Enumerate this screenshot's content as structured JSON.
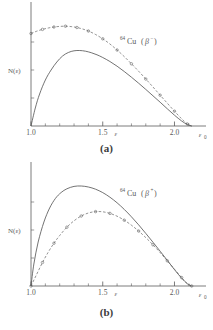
{
  "figure": {
    "background_color": "#ffffff",
    "ink_color": "#5a5a5a",
    "panels": [
      {
        "id": "a",
        "caption": "(a)",
        "ylabel": "N(ε)",
        "xlabel": "ε",
        "endpoint_label": "ε",
        "endpoint_sub": "0",
        "nuclide_mass": "64",
        "nuclide_symbol": "Cu",
        "decay_open": "(",
        "decay_beta": "β",
        "decay_sign": "−",
        "decay_close": ")",
        "series_label_full": "⁶⁴Cu (β⁻)",
        "ticks": [
          {
            "value": 1.0,
            "label": "1.0"
          },
          {
            "value": 1.5,
            "label": "1.5"
          },
          {
            "value": 2.0,
            "label": "2.0"
          }
        ]
      },
      {
        "id": "b",
        "caption": "(b)",
        "ylabel": "N(ε)",
        "xlabel": "ε",
        "endpoint_label": "ε",
        "endpoint_sub": "0",
        "nuclide_mass": "64",
        "nuclide_symbol": "Cu",
        "decay_open": "(",
        "decay_beta": "β",
        "decay_sign": "+",
        "decay_close": ")",
        "series_label_full": "⁶⁴Cu (β⁺)",
        "ticks": [
          {
            "value": 1.0,
            "label": "1.0"
          },
          {
            "value": 1.5,
            "label": "1.5"
          },
          {
            "value": 2.0,
            "label": "2.0"
          }
        ]
      }
    ]
  },
  "chart_data": [
    {
      "type": "line",
      "panel": "a",
      "title": "⁶⁴Cu (β⁻) beta spectrum",
      "xlabel": "ε",
      "ylabel": "N(ε)",
      "xlim": [
        1.0,
        2.15
      ],
      "ylim": [
        0,
        1.12
      ],
      "grid": false,
      "legend": "none",
      "endpoint_energy": 2.12,
      "xticks": [
        1.0,
        1.5,
        2.0
      ],
      "xticklabels": [
        "1.0",
        "1.5",
        "2.0"
      ],
      "minor_ticks_per_interval": 4,
      "series": [
        {
          "name": "theoretical-statistical-shape",
          "style": "solid",
          "markers": false,
          "x": [
            1.0,
            1.03,
            1.06,
            1.1,
            1.14,
            1.18,
            1.22,
            1.26,
            1.3,
            1.34,
            1.38,
            1.42,
            1.46,
            1.5,
            1.55,
            1.6,
            1.65,
            1.7,
            1.75,
            1.8,
            1.85,
            1.9,
            1.95,
            2.0,
            2.05,
            2.09,
            2.12
          ],
          "y": [
            0.0,
            0.18,
            0.32,
            0.46,
            0.56,
            0.64,
            0.7,
            0.735,
            0.752,
            0.755,
            0.748,
            0.733,
            0.712,
            0.685,
            0.645,
            0.598,
            0.545,
            0.488,
            0.428,
            0.366,
            0.302,
            0.238,
            0.172,
            0.108,
            0.05,
            0.014,
            0.0
          ]
        },
        {
          "name": "measured-corrected-spectrum",
          "style": "dashed",
          "markers": true,
          "marker_shape": "circle",
          "x": [
            1.0,
            1.04,
            1.08,
            1.12,
            1.16,
            1.2,
            1.24,
            1.28,
            1.32,
            1.36,
            1.4,
            1.45,
            1.5,
            1.55,
            1.6,
            1.65,
            1.7,
            1.75,
            1.8,
            1.85,
            1.9,
            1.95,
            2.0,
            2.05,
            2.09,
            2.12
          ],
          "y": [
            0.925,
            0.948,
            0.966,
            0.98,
            0.99,
            0.996,
            0.998,
            0.994,
            0.985,
            0.97,
            0.95,
            0.915,
            0.872,
            0.82,
            0.76,
            0.694,
            0.622,
            0.548,
            0.47,
            0.39,
            0.308,
            0.228,
            0.148,
            0.072,
            0.02,
            0.0
          ]
        }
      ],
      "annotations": [
        {
          "text": "⁶⁴Cu (β⁻)",
          "x": 1.62,
          "y": 0.82
        }
      ]
    },
    {
      "type": "line",
      "panel": "b",
      "title": "⁶⁴Cu (β⁺) beta spectrum",
      "xlabel": "ε",
      "ylabel": "N(ε)",
      "xlim": [
        1.0,
        2.15
      ],
      "ylim": [
        0,
        1.12
      ],
      "grid": false,
      "legend": "none",
      "endpoint_energy": 2.12,
      "xticks": [
        1.0,
        1.5,
        2.0
      ],
      "xticklabels": [
        "1.0",
        "1.5",
        "2.0"
      ],
      "minor_ticks_per_interval": 4,
      "series": [
        {
          "name": "theoretical-statistical-shape",
          "style": "solid",
          "markers": false,
          "x": [
            1.0,
            1.02,
            1.05,
            1.09,
            1.13,
            1.17,
            1.21,
            1.25,
            1.3,
            1.35,
            1.4,
            1.45,
            1.5,
            1.55,
            1.6,
            1.65,
            1.7,
            1.75,
            1.8,
            1.85,
            1.9,
            1.95,
            2.0,
            2.05,
            2.09,
            2.12
          ],
          "y": [
            0.0,
            0.22,
            0.44,
            0.64,
            0.78,
            0.875,
            0.935,
            0.972,
            0.996,
            1.0,
            0.99,
            0.968,
            0.934,
            0.888,
            0.832,
            0.766,
            0.692,
            0.612,
            0.526,
            0.438,
            0.348,
            0.256,
            0.164,
            0.078,
            0.022,
            0.0
          ]
        },
        {
          "name": "measured-corrected-spectrum",
          "style": "dashed",
          "markers": true,
          "marker_shape": "circle",
          "x": [
            1.0,
            1.04,
            1.08,
            1.12,
            1.16,
            1.2,
            1.25,
            1.3,
            1.35,
            1.4,
            1.45,
            1.5,
            1.55,
            1.6,
            1.65,
            1.7,
            1.75,
            1.8,
            1.85,
            1.9,
            1.95,
            2.0,
            2.05,
            2.09,
            2.12
          ],
          "y": [
            0.0,
            0.118,
            0.235,
            0.338,
            0.428,
            0.505,
            0.588,
            0.652,
            0.7,
            0.73,
            0.744,
            0.742,
            0.726,
            0.698,
            0.658,
            0.608,
            0.55,
            0.484,
            0.412,
            0.334,
            0.252,
            0.168,
            0.084,
            0.024,
            0.0
          ]
        }
      ],
      "annotations": [
        {
          "text": "⁶⁴Cu (β⁺)",
          "x": 1.62,
          "y": 0.9
        }
      ]
    }
  ]
}
